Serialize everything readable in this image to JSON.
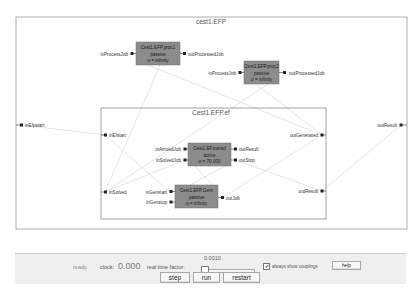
{
  "diagram": {
    "outer": {
      "title": "cest1.EFP",
      "ports_in": [
        "inEfpstart"
      ],
      "ports_out": [
        "outResult"
      ]
    },
    "gen1": {
      "lines": [
        "Cest1.EFP.proc1",
        "passive",
        "σ = infinity"
      ],
      "in": "inProcessJob",
      "out": "outProcessedJob"
    },
    "gen2": {
      "lines": [
        "Cest1.EFP.proc2",
        "passive",
        "σ = infinity"
      ],
      "in": "inProcessJob",
      "out": "outProcessedJob"
    },
    "inner": {
      "title": "Cest1.EFP.ef",
      "ports_in": [
        "inEfstart",
        "inSolved"
      ],
      "ports_out": [
        "outGenerated",
        "outResult"
      ]
    },
    "transd": {
      "lines": [
        "Cest1.EF.transd",
        "active",
        "σ = 70.000"
      ],
      "in": [
        "inArrivedJob",
        "inSolvedJob"
      ],
      "out": [
        "outResult",
        "outStop"
      ]
    },
    "genr": {
      "lines": [
        "Cest1.EFP.Genr",
        "passive",
        "σ = infinity"
      ],
      "in": [
        "inGenstart",
        "inGenstop"
      ],
      "out": [
        "outJob"
      ]
    },
    "colors": {
      "block_fill": "#8c8c8c",
      "block_border": "#6e6e6e",
      "coupling_line": "#cfcfcf",
      "box_border": "#7a7a7a"
    }
  },
  "panel": {
    "status": "ready",
    "clock_label": "clock:",
    "clock_value": "0.000",
    "rtf_label": "real time factor:",
    "rtf_value": "0.0010",
    "rtf_slider_fraction": 0.0,
    "couplings_checked": true,
    "couplings_mark": "✔",
    "couplings_label": "always show couplings",
    "help_label": "help",
    "step_label": "step",
    "run_label": "run",
    "restart_label": "restart"
  }
}
